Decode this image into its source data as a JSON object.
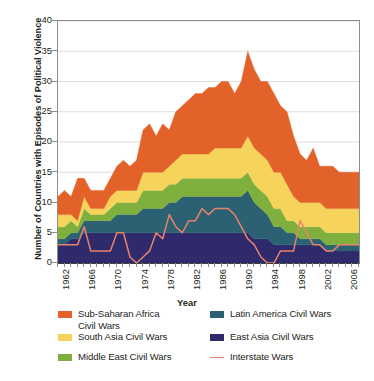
{
  "chart_data": {
    "type": "area",
    "stacked": true,
    "title": "",
    "xlabel": "Year",
    "ylabel": "Number of Countries with Episodes of Political Violence",
    "ylim": [
      0,
      40
    ],
    "yticks": [
      0,
      5,
      10,
      15,
      20,
      25,
      30,
      35,
      40
    ],
    "xlim": [
      1962,
      2008
    ],
    "xticks": [
      1962,
      1966,
      1970,
      1974,
      1978,
      1982,
      1986,
      1990,
      1994,
      1998,
      2002,
      2006
    ],
    "grid": "horizontal",
    "legend_position": "below",
    "x": [
      1962,
      1963,
      1964,
      1965,
      1966,
      1967,
      1968,
      1969,
      1970,
      1971,
      1972,
      1973,
      1974,
      1975,
      1976,
      1977,
      1978,
      1979,
      1980,
      1981,
      1982,
      1983,
      1984,
      1985,
      1986,
      1987,
      1988,
      1989,
      1990,
      1991,
      1992,
      1993,
      1994,
      1995,
      1996,
      1997,
      1998,
      1999,
      2000,
      2001,
      2002,
      2003,
      2004,
      2005,
      2006,
      2007,
      2008
    ],
    "series": [
      {
        "name": "East Asia Civil Wars",
        "color": "#2e2a6b",
        "values": [
          3,
          3,
          4,
          4,
          5,
          5,
          5,
          5,
          5,
          5,
          5,
          5,
          5,
          5,
          5,
          5,
          5,
          5,
          5,
          5,
          5,
          5,
          5,
          5,
          5,
          5,
          5,
          5,
          5,
          5,
          4,
          4,
          4,
          3,
          3,
          3,
          3,
          3,
          3,
          3,
          3,
          2,
          2,
          2,
          2,
          2,
          2
        ]
      },
      {
        "name": "Latin America Civil Wars",
        "color": "#2c6174",
        "values": [
          1,
          1,
          1,
          1,
          2,
          2,
          2,
          2,
          2,
          3,
          3,
          3,
          3,
          4,
          4,
          4,
          4,
          5,
          5,
          6,
          6,
          6,
          6,
          6,
          6,
          6,
          6,
          6,
          6,
          7,
          6,
          5,
          4,
          3,
          3,
          2,
          2,
          1,
          1,
          1,
          1,
          1,
          1,
          1,
          1,
          1,
          1
        ]
      },
      {
        "name": "Middle East Civil Wars",
        "color": "#7fb03e",
        "values": [
          2,
          2,
          2,
          1,
          2,
          1,
          1,
          1,
          2,
          2,
          2,
          2,
          2,
          3,
          3,
          3,
          3,
          3,
          3,
          3,
          3,
          3,
          3,
          3,
          3,
          3,
          3,
          3,
          3,
          3,
          3,
          3,
          3,
          3,
          3,
          2,
          2,
          2,
          2,
          2,
          2,
          2,
          2,
          2,
          2,
          2,
          2
        ]
      },
      {
        "name": "South Asia Civil Wars",
        "color": "#f6d45c",
        "values": [
          2,
          2,
          1,
          1,
          2,
          1,
          1,
          1,
          2,
          2,
          2,
          2,
          2,
          3,
          3,
          3,
          3,
          3,
          4,
          4,
          4,
          4,
          4,
          4,
          5,
          5,
          5,
          5,
          5,
          6,
          6,
          6,
          6,
          6,
          6,
          6,
          4,
          4,
          4,
          4,
          4,
          4,
          4,
          4,
          4,
          4,
          4
        ]
      },
      {
        "name": "Sub-Saharan Africa Civil Wars",
        "color": "#e2622a",
        "values": [
          3,
          4,
          3,
          7,
          3,
          3,
          3,
          3,
          3,
          4,
          5,
          4,
          5,
          7,
          8,
          6,
          8,
          6,
          8,
          8,
          9,
          10,
          10,
          11,
          10,
          11,
          11,
          9,
          11,
          14,
          13,
          12,
          13,
          13,
          11,
          12,
          10,
          8,
          7,
          9,
          6,
          7,
          7,
          6,
          6,
          6,
          6
        ]
      }
    ],
    "line_series": {
      "name": "Interstate Wars",
      "color": "#e8836b",
      "values": [
        3,
        3,
        3,
        3,
        6,
        2,
        2,
        2,
        2,
        5,
        5,
        1,
        0,
        1,
        2,
        5,
        4,
        8,
        6,
        5,
        7,
        7,
        9,
        8,
        9,
        9,
        9,
        8,
        6,
        4,
        3,
        1,
        0,
        0,
        2,
        2,
        2,
        7,
        5,
        3,
        3,
        2,
        2,
        3,
        3,
        3,
        3
      ]
    }
  },
  "axes": {
    "ylabel": "Number of Countries with Episodes of Political Violence",
    "xlabel": "Year"
  },
  "legend": {
    "items": [
      {
        "label": "Sub-Saharan Africa Civil Wars",
        "color": "#e2622a",
        "type": "swatch"
      },
      {
        "label": "South Asia Civil Wars",
        "color": "#f6d45c",
        "type": "swatch"
      },
      {
        "label": "Middle East Civil Wars",
        "color": "#7fb03e",
        "type": "swatch"
      },
      {
        "label": "Latin America Civil Wars",
        "color": "#2c6174",
        "type": "swatch"
      },
      {
        "label": "East Asia Civil Wars",
        "color": "#2e2a6b",
        "type": "swatch"
      },
      {
        "label": "Interstate Wars",
        "color": "#e8836b",
        "type": "line"
      }
    ]
  },
  "caption": ""
}
